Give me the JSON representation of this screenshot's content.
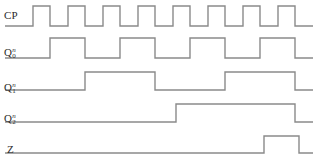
{
  "diagram": {
    "type": "digital-timing-diagram",
    "title": "",
    "width": 321,
    "height": 166,
    "background_color": "#ffffff",
    "waveform_color": "#8a8a8a",
    "label_color": "#2b2b2b",
    "time_axis": {
      "start_x": 5,
      "first_edge_x": 33,
      "clock_period_px": 35,
      "clock_high_px": 17,
      "end_x": 313,
      "cycles_shown": 8
    },
    "signals": [
      {
        "name": "CP",
        "label_base": "CP",
        "label_sub": "",
        "label_sup": "",
        "row_index": 0,
        "high_y": 6,
        "low_y": 26,
        "description": "clock pulse input",
        "transitions_x": [
          33,
          50,
          68,
          85,
          103,
          120,
          138,
          155,
          173,
          190,
          208,
          225,
          243,
          260,
          278,
          295
        ],
        "initial_level": "low",
        "bits": [
          0,
          1,
          0,
          1,
          0,
          1,
          0,
          1,
          0,
          1,
          0,
          1,
          0,
          1,
          0,
          1,
          0
        ]
      },
      {
        "name": "Q0n",
        "label_base": "Q",
        "label_sub": "0",
        "label_sup": "n",
        "row_index": 1,
        "high_y": 38,
        "low_y": 58,
        "description": "counter bit 0 output, divides clock by 2",
        "transitions_x": [
          50,
          85,
          120,
          155,
          190,
          225,
          260,
          295
        ],
        "initial_level": "low",
        "bits": [
          0,
          1,
          0,
          1,
          0,
          1,
          0,
          1,
          0
        ]
      },
      {
        "name": "Q1n",
        "label_base": "Q",
        "label_sub": "1",
        "label_sup": "n",
        "row_index": 2,
        "high_y": 72,
        "low_y": 90,
        "description": "counter bit 1 output, divides clock by 4",
        "transitions_x": [
          85,
          155,
          225,
          295
        ],
        "initial_level": "low",
        "bits": [
          0,
          1,
          0,
          1,
          0
        ]
      },
      {
        "name": "Q2n",
        "label_base": "Q",
        "label_sub": "2",
        "label_sup": "n",
        "row_index": 3,
        "high_y": 104,
        "low_y": 122,
        "description": "counter bit 2 output, divides clock by 8",
        "transitions_x": [
          176,
          295
        ],
        "initial_level": "low",
        "bits": [
          0,
          1,
          0
        ]
      },
      {
        "name": "Z",
        "label_base": "Z",
        "label_sub": "",
        "label_sup": "",
        "row_index": 4,
        "high_y": 136,
        "low_y": 153,
        "description": "decoded output pulse on terminal count",
        "transitions_x": [
          264,
          299
        ],
        "initial_level": "low",
        "bits": [
          0,
          1,
          0
        ]
      }
    ]
  }
}
